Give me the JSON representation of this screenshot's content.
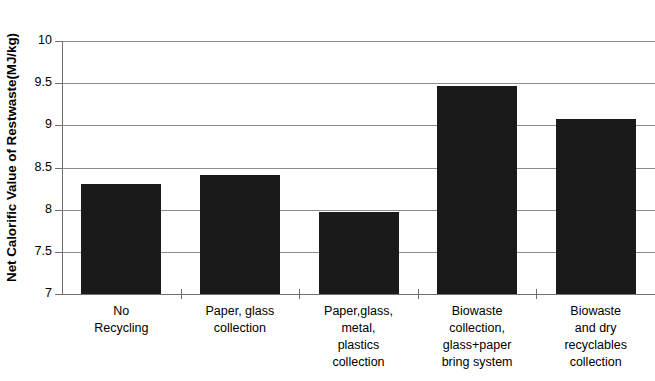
{
  "chart_data": {
    "type": "bar",
    "title": "",
    "xlabel": "",
    "ylabel": "Net Calorific Value of Restwaste(MJ/kg)",
    "ylim": [
      7,
      10
    ],
    "ytick_labels": [
      "10",
      "9.5",
      "9",
      "8.5",
      "8",
      "7.5",
      "7"
    ],
    "ytick_values": [
      10,
      9.5,
      9,
      8.5,
      8,
      7.5,
      7
    ],
    "grid": true,
    "legend": "none",
    "bar_color": "#1a1a1a",
    "gridline_color": "#8c8c8c",
    "axis_color": "#6f6f6f",
    "categories": [
      "No Recycling",
      "Paper, glass collection",
      "Paper,glass, metal, plastics collection",
      "Biowaste collection, glass+paper bring system",
      "Biowaste and dry recyclables collection"
    ],
    "category_lines": [
      [
        "No",
        "Recycling"
      ],
      [
        "Paper, glass",
        "collection"
      ],
      [
        "Paper,glass,",
        "metal,",
        "plastics",
        "collection"
      ],
      [
        "Biowaste",
        "collection,",
        "glass+paper",
        "bring system"
      ],
      [
        "Biowaste",
        "and dry",
        "recyclables",
        "collection"
      ]
    ],
    "values": [
      8.3,
      8.41,
      7.97,
      9.47,
      9.07
    ]
  }
}
